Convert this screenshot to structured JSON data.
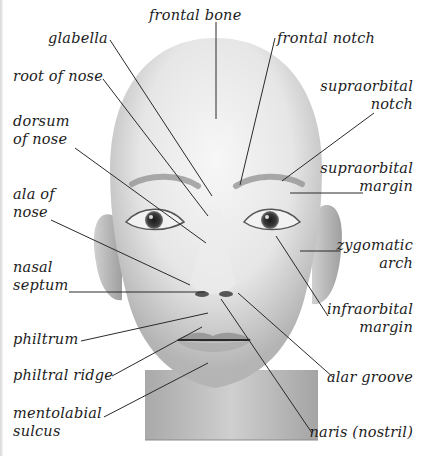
{
  "diagram": {
    "colors": {
      "background": "#ffffff",
      "text": "#1c1c1c",
      "leader_line": "#2a2a2a",
      "skin_light": "#f2f2f2",
      "skin_mid": "#cfcfcf",
      "skin_dark": "#9a9a9a"
    },
    "labels_left": [
      {
        "id": "glabella",
        "text": "glabella"
      },
      {
        "id": "root-of-nose",
        "text": "root of nose"
      },
      {
        "id": "dorsum-of-nose",
        "text": "dorsum\nof nose"
      },
      {
        "id": "ala-of-nose",
        "text": "ala of\nnose"
      },
      {
        "id": "nasal-septum",
        "text": "nasal\nseptum"
      },
      {
        "id": "philtrum",
        "text": "philtrum"
      },
      {
        "id": "philtral-ridge",
        "text": "philtral ridge"
      },
      {
        "id": "mentolabial-sulcus",
        "text": "mentolabial\nsulcus"
      }
    ],
    "labels_top": [
      {
        "id": "frontal-bone",
        "text": "frontal bone"
      },
      {
        "id": "frontal-notch",
        "text": "frontal notch"
      }
    ],
    "labels_right": [
      {
        "id": "supraorbital-notch",
        "text": "supraorbital\nnotch"
      },
      {
        "id": "supraorbital-margin",
        "text": "supraorbital\nmargin"
      },
      {
        "id": "zygomatic-arch",
        "text": "zygomatic\narch"
      },
      {
        "id": "infraorbital-margin",
        "text": "infraorbital\nmargin"
      },
      {
        "id": "alar-groove",
        "text": "alar groove"
      },
      {
        "id": "naris-nostril",
        "text": "naris (nostril)"
      }
    ]
  }
}
